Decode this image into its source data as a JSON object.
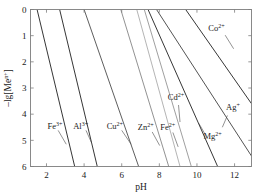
{
  "figure": {
    "background": "#ffffff",
    "frame_color": "#7d7d7d"
  },
  "axes": {
    "x_title": "pH",
    "y_title": "–lg[Me",
    "y_title_sup": "n+",
    "y_title_tail": "]",
    "x_ticks": [
      "2",
      "4",
      "6",
      "8",
      "10",
      "12"
    ],
    "x_tick_values": [
      2,
      4,
      6,
      8,
      10,
      12
    ],
    "y_ticks": [
      "0",
      "1",
      "2",
      "3",
      "4",
      "5",
      "6"
    ],
    "y_tick_values": [
      0,
      1,
      2,
      3,
      4,
      5,
      6
    ]
  },
  "chart_data": {
    "type": "line",
    "title": "",
    "xlabel": "pH",
    "ylabel": "–lg[Me^n+]",
    "xlim": [
      1.15,
      12.9
    ],
    "ylim": [
      0,
      6
    ],
    "y_inverted": true,
    "grid": false,
    "legend": "inline-annotations",
    "series": [
      {
        "name": "Fe3+",
        "label": "Fe",
        "label_sup": "3+",
        "color": "#2b2b2b",
        "x": [
          1.5,
          3.5
        ],
        "y": [
          0,
          6
        ],
        "label_x": 2.05,
        "label_y": 4.55,
        "leader": [
          [
            2.62,
            4.62
          ],
          [
            3.05,
            5.15
          ]
        ]
      },
      {
        "name": "Al3+",
        "label": "Al",
        "label_sup": "3+",
        "color": "#2b2b2b",
        "x": [
          2.7,
          4.7
        ],
        "y": [
          0,
          6
        ],
        "label_x": 3.42,
        "label_y": 4.55,
        "leader": [
          [
            4.1,
            4.62
          ],
          [
            4.4,
            5.1
          ]
        ]
      },
      {
        "name": "Cu2+",
        "label": "Cu",
        "label_sup": "2+",
        "color": "#555555",
        "x": [
          4.0,
          6.9
        ],
        "y": [
          0,
          6
        ],
        "label_x": 5.2,
        "label_y": 4.55,
        "leader": [
          [
            6.0,
            4.62
          ],
          [
            6.5,
            5.15
          ]
        ]
      },
      {
        "name": "Zn2+",
        "label": "Zn",
        "label_sup": "2+",
        "color": "#8c8c8c",
        "x": [
          5.95,
          8.5
        ],
        "y": [
          0,
          6
        ],
        "label_x": 6.85,
        "label_y": 4.6,
        "leader": [
          [
            7.62,
            4.68
          ],
          [
            8.02,
            5.2
          ]
        ]
      },
      {
        "name": "Fe2+",
        "label": "Fe",
        "label_sup": "2+",
        "color": "#b0b0b0",
        "x": [
          6.8,
          9.1
        ],
        "y": [
          0,
          6
        ],
        "label_x": 8.05,
        "label_y": 4.6,
        "leader": [
          [
            8.72,
            4.7
          ],
          [
            9.0,
            5.25
          ]
        ]
      },
      {
        "name": "Cd2+",
        "label": "Cd",
        "label_sup": "2+",
        "color": "#9a9a9a",
        "x": [
          7.2,
          9.7
        ],
        "y": [
          0,
          6
        ],
        "label_x": 8.45,
        "label_y": 3.45,
        "leader": [
          [
            9.02,
            3.65
          ],
          [
            9.1,
            4.3
          ]
        ]
      },
      {
        "name": "Mg2+",
        "label": "Mg",
        "label_sup": "2+",
        "color": "#2b2b2b",
        "x": [
          7.4,
          11.1
        ],
        "y": [
          0,
          6
        ],
        "label_x": 10.35,
        "label_y": 4.95,
        "leader": [
          [
            10.42,
            4.75
          ],
          [
            10.1,
            4.35
          ]
        ]
      },
      {
        "name": "Ag+",
        "label": "Ag",
        "label_sup": "+",
        "color": "#4a4a4a",
        "x": [
          7.85,
          12.9
        ],
        "y": [
          0,
          5.6
        ],
        "label_x": 11.55,
        "label_y": 3.85,
        "leader": [
          [
            11.62,
            4.05
          ],
          [
            11.35,
            4.5
          ]
        ]
      },
      {
        "name": "Co2+",
        "label": "Co",
        "label_sup": "2+",
        "color": "#2b2b2b",
        "x": [
          9.4,
          12.9
        ],
        "y": [
          0,
          3.6
        ],
        "label_x": 10.6,
        "label_y": 0.82,
        "leader": [
          [
            11.5,
            0.98
          ],
          [
            11.95,
            1.5
          ]
        ]
      }
    ]
  }
}
